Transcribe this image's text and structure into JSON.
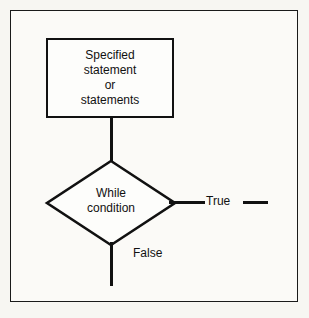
{
  "diagram": {
    "type": "flowchart",
    "background_color": "#f7f6f2",
    "frame_color": "#1a1a1a",
    "stroke_color": "#111111",
    "nodes": {
      "process": {
        "shape": "rectangle",
        "lines": [
          "Specified",
          "statement",
          "or",
          "statements"
        ]
      },
      "decision": {
        "shape": "diamond",
        "lines": [
          "While",
          "condition"
        ]
      }
    },
    "edges": {
      "process_to_decision": {
        "label": ""
      },
      "true_branch": {
        "label": "True",
        "direction": "right"
      },
      "false_branch": {
        "label": "False",
        "direction": "down"
      }
    }
  }
}
